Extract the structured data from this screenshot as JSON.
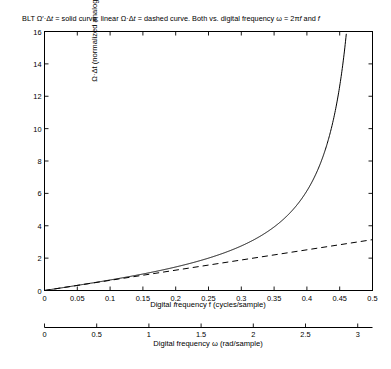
{
  "figure": {
    "title_segments": [
      {
        "t": "BLT ",
        "i": false
      },
      {
        "t": "Ω′·Δ",
        "i": false
      },
      {
        "t": "t",
        "i": true
      },
      {
        "t": " = solid curve; linear ",
        "i": false
      },
      {
        "t": "Ω·Δ",
        "i": false
      },
      {
        "t": "t",
        "i": true
      },
      {
        "t": " = dashed curve.  Both vs. digital frequency ",
        "i": false
      },
      {
        "t": "ω",
        "i": false
      },
      {
        "t": " = 2π",
        "i": false
      },
      {
        "t": "f",
        "i": true
      },
      {
        "t": " and ",
        "i": false
      },
      {
        "t": "f",
        "i": true
      }
    ],
    "title_plain": "BLT Ω′·Δt = solid curve; linear Ω·Δt = dashed curve.  Both vs. digital frequency ω = 2πf and f",
    "background_color": "#ffffff",
    "line_color": "#000000",
    "axis_color": "#000000"
  },
  "chart_data": {
    "type": "line",
    "title": "BLT Ω′·Δt = solid curve; linear Ω·Δt = dashed curve.  Both vs. digital frequency ω = 2πf and f",
    "xlabel": "Digital frequency f (cycles/sample)",
    "xlabel2": "Digital frequency ω (rad/sample)",
    "ylabel": "Ω·Δt (normalized analog radian frequency)",
    "xlim": [
      0,
      0.5
    ],
    "ylim": [
      0,
      16
    ],
    "xlim2": [
      0,
      3.14159
    ],
    "grid": false,
    "legend": "none",
    "xticks": [
      0,
      0.05,
      0.1,
      0.15,
      0.2,
      0.25,
      0.3,
      0.35,
      0.4,
      0.45,
      0.5
    ],
    "xticklabels": [
      "0",
      "0.05",
      "0.1",
      "0.15",
      "0.2",
      "0.25",
      "0.3",
      "0.35",
      "0.4",
      "0.45",
      "0.5"
    ],
    "yticks": [
      0,
      2,
      4,
      6,
      8,
      10,
      12,
      14,
      16
    ],
    "yticklabels": [
      "0",
      "2",
      "4",
      "6",
      "8",
      "10",
      "12",
      "14",
      "16"
    ],
    "xticks2": [
      0,
      0.5,
      1,
      1.5,
      2,
      2.5,
      3
    ],
    "xticklabels2": [
      "0",
      "0.5",
      "1",
      "1.5",
      "2",
      "2.5",
      "3"
    ],
    "series": [
      {
        "name": "BLT Ω′·Δt = 2·tan(πf)",
        "style": "solid",
        "formula": "2*tan(pi*f)",
        "x": [
          0,
          0.02,
          0.04,
          0.06,
          0.08,
          0.1,
          0.12,
          0.14,
          0.16,
          0.18,
          0.2,
          0.22,
          0.24,
          0.26,
          0.28,
          0.3,
          0.32,
          0.34,
          0.36,
          0.38,
          0.4,
          0.41,
          0.42,
          0.43,
          0.44,
          0.45,
          0.455,
          0.4603
        ],
        "y": [
          0,
          0.1257,
          0.2531,
          0.3837,
          0.5193,
          0.6498,
          0.8098,
          0.9706,
          1.1418,
          1.3263,
          1.5279,
          1.7514,
          2.0029,
          2.2907,
          2.6261,
          3.0249,
          3.5114,
          4.1242,
          4.926,
          6.0294,
          7.6942,
          8.8428,
          10.35,
          12.424,
          15.507,
          20.54,
          24.21,
          16.0
        ],
        "y_clipped_at": 16.0
      },
      {
        "name": "linear Ω·Δt = 2πf",
        "style": "dashed",
        "formula": "2*pi*f",
        "x": [
          0,
          0.05,
          0.1,
          0.15,
          0.2,
          0.25,
          0.3,
          0.35,
          0.4,
          0.45,
          0.5
        ],
        "y": [
          0,
          0.3142,
          0.6283,
          0.9425,
          1.2566,
          1.5708,
          1.885,
          2.1991,
          2.5133,
          2.8274,
          3.1416
        ]
      }
    ]
  }
}
